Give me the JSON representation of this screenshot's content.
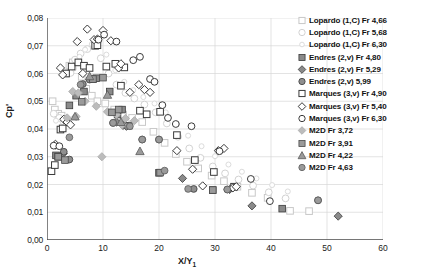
{
  "chart_data": {
    "type": "scatter",
    "title": "",
    "xlabel": "X/Y 1",
    "ylabel": "Cp'",
    "xlim": [
      0,
      60
    ],
    "ylim": [
      0,
      0.08
    ],
    "xticks": [
      "0",
      "10",
      "20",
      "30",
      "40",
      "50",
      "60"
    ],
    "xtick_values": [
      0,
      10,
      20,
      30,
      40,
      50,
      60
    ],
    "yticks": [
      "0,00",
      "0,01",
      "0,02",
      "0,03",
      "0,04",
      "0,05",
      "0,06",
      "0,07",
      "0,08"
    ],
    "ytick_values": [
      0,
      0.01,
      0.02,
      0.03,
      0.04,
      0.05,
      0.06,
      0.07,
      0.08
    ],
    "grid": "horizontal-and-vertical-light",
    "legend_position": "right",
    "decimal_separator": "comma",
    "series": [
      {
        "name": "Lopardo (1,C) Fr 4,66",
        "marker": "square",
        "fill": "none",
        "color": "#d9d9d9",
        "edge": "#c8c8c8",
        "points": [
          [
            1.0,
            0.05
          ],
          [
            1.4,
            0.047
          ],
          [
            2.0,
            0.0455
          ],
          [
            2.6,
            0.0448
          ],
          [
            3.4,
            0.06
          ],
          [
            4.0,
            0.0628
          ],
          [
            4.6,
            0.064
          ],
          [
            5.4,
            0.0645
          ],
          [
            6.2,
            0.0588
          ],
          [
            7.0,
            0.0545
          ],
          [
            8.0,
            0.052
          ],
          [
            9.0,
            0.05
          ],
          [
            10.4,
            0.0492
          ],
          [
            12.0,
            0.047
          ],
          [
            13.6,
            0.0452
          ],
          [
            15.2,
            0.044
          ],
          [
            17.0,
            0.0425
          ],
          [
            19.0,
            0.039
          ],
          [
            21.0,
            0.035
          ],
          [
            23.0,
            0.031
          ],
          [
            25.0,
            0.0282
          ],
          [
            27.0,
            0.0258
          ],
          [
            29.4,
            0.0232
          ],
          [
            31.6,
            0.0212
          ],
          [
            34.0,
            0.0192
          ],
          [
            36.6,
            0.017
          ],
          [
            39.4,
            0.0152
          ],
          [
            43.4,
            0.0105
          ],
          [
            46.8,
            0.0104
          ]
        ]
      },
      {
        "name": "Lopardo (1,C) Fr 5,68",
        "marker": "circle",
        "fill": "none",
        "color": "#e2e2e2",
        "edge": "#d2d2d2",
        "points": [
          [
            1.2,
            0.0455
          ],
          [
            2.2,
            0.044
          ],
          [
            3.0,
            0.0432
          ],
          [
            4.2,
            0.0602
          ],
          [
            5.0,
            0.065
          ],
          [
            6.0,
            0.0672
          ],
          [
            7.2,
            0.0688
          ],
          [
            8.4,
            0.07
          ],
          [
            9.6,
            0.0655
          ],
          [
            11.0,
            0.06
          ],
          [
            12.4,
            0.056
          ],
          [
            14.0,
            0.053
          ],
          [
            15.6,
            0.051
          ],
          [
            17.4,
            0.0488
          ],
          [
            19.4,
            0.046
          ],
          [
            21.4,
            0.042
          ],
          [
            23.4,
            0.0372
          ],
          [
            25.4,
            0.033
          ],
          [
            27.4,
            0.0296
          ],
          [
            29.6,
            0.0265
          ],
          [
            31.8,
            0.024
          ],
          [
            34.2,
            0.0218
          ],
          [
            36.8,
            0.0196
          ],
          [
            39.6,
            0.0172
          ],
          [
            42.6,
            0.015
          ]
        ]
      },
      {
        "name": "Lopardo (1,C) Fr 6,30",
        "marker": "circle-small",
        "fill": "none",
        "color": "#ececec",
        "edge": "#dcdcdc",
        "points": [
          [
            1.6,
            0.043
          ],
          [
            2.8,
            0.0425
          ],
          [
            4.8,
            0.0618
          ],
          [
            5.8,
            0.066
          ],
          [
            6.8,
            0.0686
          ],
          [
            8.0,
            0.0706
          ],
          [
            9.2,
            0.0712
          ],
          [
            10.6,
            0.0668
          ],
          [
            12.2,
            0.0612
          ],
          [
            13.8,
            0.057
          ],
          [
            15.4,
            0.054
          ],
          [
            17.2,
            0.0515
          ],
          [
            19.2,
            0.0492
          ],
          [
            21.2,
            0.046
          ],
          [
            23.2,
            0.0418
          ],
          [
            25.2,
            0.0376
          ],
          [
            27.6,
            0.0338
          ],
          [
            30.0,
            0.0302
          ],
          [
            32.4,
            0.0272
          ],
          [
            34.8,
            0.0246
          ],
          [
            37.4,
            0.0222
          ],
          [
            40.2,
            0.0198
          ],
          [
            43.0,
            0.0175
          ]
        ]
      },
      {
        "name": "Endres (2,v) Fr 4,80",
        "marker": "square",
        "fill": "solid",
        "color": "#8a8a8a",
        "edge": "#3a3a3a",
        "points": [
          [
            1.6,
            0.0305
          ],
          [
            4.0,
            0.0485
          ],
          [
            5.2,
            0.052
          ],
          [
            6.6,
            0.0535
          ],
          [
            8.2,
            0.058
          ],
          [
            8.8,
            0.0583
          ],
          [
            11.2,
            0.0535
          ],
          [
            12.6,
            0.0452
          ],
          [
            13.4,
            0.047
          ],
          [
            14.6,
            0.0412
          ],
          [
            20.0,
            0.0242
          ],
          [
            29.6,
            0.018
          ],
          [
            42.0,
            0.0113
          ]
        ]
      },
      {
        "name": "Endres (2,v) Fr 5,29",
        "marker": "diamond",
        "fill": "solid",
        "color": "#8a8a8a",
        "edge": "#3a3a3a",
        "points": [
          [
            1.5,
            0.0342
          ],
          [
            2.9,
            0.0312
          ],
          [
            12.4,
            0.0425
          ],
          [
            13.6,
            0.0413
          ],
          [
            14.2,
            0.041
          ],
          [
            24.2,
            0.0222
          ],
          [
            32.6,
            0.0182
          ],
          [
            36.6,
            0.0123
          ],
          [
            52.0,
            0.0086
          ]
        ]
      },
      {
        "name": "Endres (2,v) 5,99",
        "marker": "circle",
        "fill": "solid",
        "color": "#8f8f8f",
        "edge": "#3a3a3a",
        "points": [
          [
            3.0,
            0.0318
          ],
          [
            4.0,
            0.029
          ],
          [
            6.4,
            0.0562
          ],
          [
            7.6,
            0.0578
          ],
          [
            11.8,
            0.0422
          ],
          [
            17.0,
            0.0362
          ],
          [
            20.0,
            0.0362
          ],
          [
            26.2,
            0.0184
          ],
          [
            32.2,
            0.0182
          ],
          [
            48.4,
            0.0143
          ]
        ]
      },
      {
        "name": "Marques (3,v) Fr 4,90",
        "marker": "square",
        "fill": "none",
        "color": "#ffffff",
        "edge": "#3a3a3a",
        "points": [
          [
            0.8,
            0.0248
          ],
          [
            1.4,
            0.027
          ],
          [
            2.0,
            0.03
          ],
          [
            2.4,
            0.0398
          ],
          [
            2.8,
            0.0402
          ],
          [
            3.4,
            0.06
          ],
          [
            4.4,
            0.0625
          ],
          [
            5.6,
            0.064
          ],
          [
            6.6,
            0.0628
          ],
          [
            7.6,
            0.062
          ],
          [
            8.6,
            0.07
          ],
          [
            9.0,
            0.0702
          ],
          [
            10.6,
            0.0625
          ],
          [
            12.2,
            0.0635
          ],
          [
            13.2,
            0.0556
          ],
          [
            13.8,
            0.0622
          ],
          [
            16.6,
            0.0466
          ],
          [
            17.8,
            0.0453
          ],
          [
            20.2,
            0.0462
          ],
          [
            23.2,
            0.0378
          ],
          [
            26.4,
            0.0288
          ],
          [
            29.8,
            0.0245
          ],
          [
            33.4,
            0.0192
          ]
        ]
      },
      {
        "name": "Marques (3,v) Fr 5,40",
        "marker": "diamond",
        "fill": "none",
        "color": "#ffffff",
        "edge": "#3a3a3a",
        "points": [
          [
            1.5,
            0.0345
          ],
          [
            2.4,
            0.062
          ],
          [
            2.8,
            0.0595
          ],
          [
            3.0,
            0.0435
          ],
          [
            3.6,
            0.0425
          ],
          [
            4.2,
            0.0415
          ],
          [
            5.4,
            0.0715
          ],
          [
            6.4,
            0.06
          ],
          [
            7.2,
            0.076
          ],
          [
            8.4,
            0.0722
          ],
          [
            9.0,
            0.0724
          ],
          [
            10.0,
            0.0755
          ],
          [
            11.4,
            0.0718
          ],
          [
            12.8,
            0.062
          ],
          [
            13.2,
            0.0635
          ],
          [
            14.8,
            0.0532
          ],
          [
            16.4,
            0.056
          ],
          [
            17.4,
            0.0542
          ],
          [
            18.4,
            0.0532
          ],
          [
            23.2,
            0.0322
          ],
          [
            26.0,
            0.0255
          ],
          [
            27.8,
            0.0195
          ],
          [
            33.2,
            0.0188
          ],
          [
            33.8,
            0.0192
          ],
          [
            31.6,
            0.033
          ],
          [
            30.6,
            0.0322
          ]
        ]
      },
      {
        "name": "Marques (3,v) Fr 6,30",
        "marker": "circle",
        "fill": "none",
        "color": "#ffffff",
        "edge": "#3a3a3a",
        "points": [
          [
            1.2,
            0.034
          ],
          [
            2.2,
            0.0338
          ],
          [
            9.2,
            0.0722
          ],
          [
            10.2,
            0.074
          ],
          [
            12.4,
            0.0715
          ],
          [
            15.4,
            0.0648
          ],
          [
            16.6,
            0.066
          ],
          [
            18.4,
            0.058
          ],
          [
            19.2,
            0.057
          ],
          [
            20.6,
            0.0486
          ],
          [
            21.6,
            0.044
          ],
          [
            23.0,
            0.0418
          ],
          [
            25.8,
            0.041
          ],
          [
            30.8,
            0.032
          ],
          [
            36.4,
            0.022
          ],
          [
            39.8,
            0.014
          ]
        ]
      },
      {
        "name": "M2D Fr 3,72",
        "marker": "diamond",
        "fill": "solid",
        "color": "#bcbcbc",
        "edge": "#a8a8a8",
        "points": [
          [
            4.6,
            0.0535
          ],
          [
            5.6,
            0.053
          ],
          [
            6.8,
            0.05
          ],
          [
            8.8,
            0.0482
          ],
          [
            10.8,
            0.0462
          ],
          [
            12.4,
            0.0452
          ],
          [
            14.0,
            0.0438
          ],
          [
            15.6,
            0.043
          ],
          [
            5.2,
            0.0445
          ],
          [
            3.6,
            0.044
          ],
          [
            9.8,
            0.03
          ],
          [
            13.4,
            0.0415
          ]
        ]
      },
      {
        "name": "M2D Fr 3,91",
        "marker": "square",
        "fill": "solid",
        "color": "#9a9a9a",
        "edge": "#4a4a4a",
        "points": [
          [
            2.0,
            0.03
          ],
          [
            3.2,
            0.0288
          ],
          [
            6.2,
            0.0498
          ],
          [
            8.2,
            0.058
          ],
          [
            10.0,
            0.0585
          ],
          [
            11.6,
            0.046
          ],
          [
            12.8,
            0.047
          ],
          [
            20.2,
            0.0243
          ],
          [
            29.6,
            0.018
          ]
        ]
      },
      {
        "name": "M2D Fr 4,22",
        "marker": "triangle",
        "fill": "solid",
        "color": "#9a9a9a",
        "edge": "#5a5a5a",
        "points": [
          [
            5.0,
            0.0445
          ],
          [
            7.6,
            0.059
          ],
          [
            10.8,
            0.0523
          ],
          [
            13.2,
            0.0425
          ],
          [
            16.6,
            0.032
          ]
        ]
      },
      {
        "name": "M2D Fr 4,63",
        "marker": "circle",
        "fill": "solid",
        "color": "#9a9a9a",
        "edge": "#5a5a5a",
        "points": [
          [
            4.0,
            0.037
          ],
          [
            6.0,
            0.056
          ],
          [
            11.8,
            0.0422
          ],
          [
            14.8,
            0.041
          ],
          [
            17.0,
            0.0362
          ],
          [
            20.0,
            0.0362
          ],
          [
            21.0,
            0.025
          ],
          [
            25.2,
            0.0184
          ],
          [
            32.2,
            0.0182
          ],
          [
            48.4,
            0.0143
          ]
        ]
      }
    ]
  },
  "legend": {
    "entries": [
      {
        "label": "Lopardo (1,C) Fr 4,66"
      },
      {
        "label": "Lopardo (1,C) Fr 5,68"
      },
      {
        "label": "Lopardo (1,C) Fr 6,30"
      },
      {
        "label": "Endres (2,v) Fr 4,80"
      },
      {
        "label": "Endres (2,v) Fr 5,29"
      },
      {
        "label": "Endres (2,v) 5,99"
      },
      {
        "label": "Marques (3,v) Fr 4,90"
      },
      {
        "label": "Marques (3,v) Fr 5,40"
      },
      {
        "label": "Marques (3,v) Fr 6,30"
      },
      {
        "label": "M2D Fr 3,72"
      },
      {
        "label": "M2D Fr 3,91"
      },
      {
        "label": "M2D Fr 4,22"
      },
      {
        "label": "M2D Fr 4,63"
      }
    ]
  },
  "axis": {
    "ylabel": "Cp'",
    "xlabel_main": "X/Y",
    "xlabel_sub": "1"
  },
  "colors": {
    "axis": "#4d4d4d",
    "grid": "#d7d7d7",
    "text": "#111111"
  }
}
